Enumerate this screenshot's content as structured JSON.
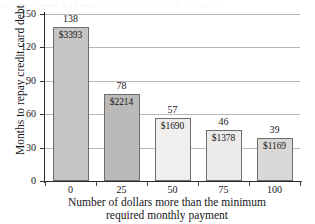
{
  "chart_data": {
    "type": "bar",
    "title": "",
    "xlabel": "Number of dollars more than the minimum required monthly payment",
    "xlabel_line1": "Number of dollars more than the minimum",
    "xlabel_line2": "required monthly payment",
    "ylabel": "Months to repay credit card debt",
    "categories": [
      "0",
      "25",
      "50",
      "75",
      "100"
    ],
    "values": [
      138,
      78,
      57,
      46,
      39
    ],
    "value_labels": [
      "138",
      "78",
      "57",
      "46",
      "39"
    ],
    "bar_inner_labels": [
      "$3393",
      "$2214",
      "$1690",
      "$1378",
      "$1169"
    ],
    "bar_colors": [
      "#c6c4c2",
      "#bcbab8",
      "#f0efee",
      "#ecebea",
      "#d9d8d6"
    ],
    "ylim": [
      0,
      150
    ],
    "yticks": [
      "0",
      "30",
      "60",
      "90",
      "120",
      "150"
    ],
    "ytick_values": [
      0,
      30,
      60,
      90,
      120,
      150
    ],
    "grid": "horizontal",
    "legend": "none",
    "gridline_color": "#b9b7b5",
    "axis_color": "#2b2a28"
  },
  "artifact": {
    "bleed_text": "the  minimum  payment  on  a  credit  card  balance"
  }
}
